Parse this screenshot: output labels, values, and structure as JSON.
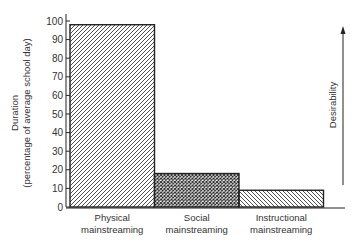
{
  "chart_data": {
    "type": "bar",
    "title": "",
    "categories": [
      "Physical mainstreaming",
      "Social mainstreaming",
      "Instructional mainstreaming"
    ],
    "category_lines": [
      [
        "Physical",
        "mainstreaming"
      ],
      [
        "Social",
        "mainstreaming"
      ],
      [
        "Instructional",
        "mainstreaming"
      ]
    ],
    "values": [
      98,
      18,
      9
    ],
    "patterns": [
      "diagonal-hatch",
      "crosshatch",
      "reverse-diagonal-hatch"
    ],
    "xlabel": "",
    "ylabel": "Duration",
    "ylabel_sub": "(percentage of average school day)",
    "ylim": [
      0,
      100
    ],
    "yticks": [
      0,
      10,
      20,
      30,
      40,
      50,
      60,
      70,
      80,
      90,
      100
    ],
    "grid": false,
    "annotations": [
      {
        "text": "Desirability",
        "type": "upward-arrow",
        "position": "right"
      }
    ]
  },
  "labels": {
    "ylabel": "Duration",
    "ylabel_sub": "(percentage of average school day)",
    "arrow_label": "Desirability"
  },
  "colors": {
    "ink": "#222222",
    "background": "#ffffff"
  }
}
